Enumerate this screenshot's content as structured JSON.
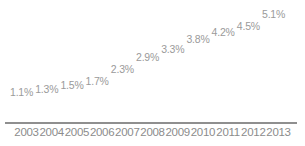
{
  "chart_data": {
    "type": "bar",
    "title": "",
    "subtitle": "",
    "xlabel": "",
    "ylabel": "",
    "categories": [
      "2003",
      "2004",
      "2005",
      "2006",
      "2007",
      "2008",
      "2009",
      "2010",
      "2011",
      "2012",
      "2013"
    ],
    "values": [
      1.1,
      1.3,
      1.5,
      1.7,
      2.3,
      2.9,
      3.3,
      3.8,
      4.2,
      4.5,
      5.1
    ],
    "data_labels": [
      "1.1%",
      "1.3%",
      "1.5%",
      "1.7%",
      "2.3%",
      "2.9%",
      "3.3%",
      "3.8%",
      "4.2%",
      "4.5%",
      "5.1%"
    ],
    "unit": "%",
    "ylim": [
      0,
      5.1
    ],
    "grid": false,
    "legend": null,
    "legend_position": "none",
    "annotations": [],
    "series": [
      {
        "name": "",
        "values": [
          1.1,
          1.3,
          1.5,
          1.7,
          2.3,
          2.9,
          3.3,
          3.8,
          4.2,
          4.5,
          5.1
        ]
      }
    ]
  },
  "style": {
    "bar_color": "#4d4d4d",
    "axis_color": "#8f8f8f",
    "label_color": "#9a9a9a",
    "category_color": "#8c8c8c",
    "background": "#ffffff"
  }
}
